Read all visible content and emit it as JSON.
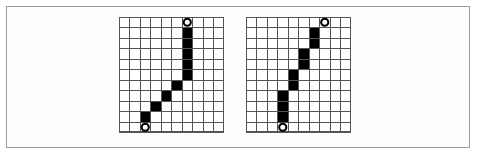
{
  "figure": {
    "title": "",
    "background_color": "#ffffff",
    "frame_color": "#9a9a9a",
    "grid_line_color": "#555555",
    "filled_cell_color": "#000000",
    "marker_fill_color": "#ffffff",
    "marker_stroke_color": "#000000",
    "panel_count": 2
  },
  "chart_data": {
    "type": "heatmap",
    "title": "",
    "subtitle": "",
    "xlabel": "",
    "ylabel": "",
    "grid": true,
    "legend_position": "none",
    "xlim": [
      0,
      10
    ],
    "ylim": [
      0,
      11
    ],
    "panels": [
      {
        "name": "left-grid",
        "cols": 10,
        "rows": 11,
        "origin_px": {
          "x": 119,
          "y": 17
        },
        "cell_px": 10.5,
        "filled_cells": [
          {
            "col": 6,
            "row": 1
          },
          {
            "col": 6,
            "row": 2
          },
          {
            "col": 6,
            "row": 3
          },
          {
            "col": 6,
            "row": 4
          },
          {
            "col": 6,
            "row": 5
          },
          {
            "col": 5,
            "row": 6
          },
          {
            "col": 4,
            "row": 7
          },
          {
            "col": 3,
            "row": 8
          },
          {
            "col": 2,
            "row": 9
          }
        ],
        "markers": [
          {
            "name": "end-marker-top",
            "col": 6,
            "row": 0
          },
          {
            "name": "start-marker-bottom",
            "col": 2,
            "row": 10
          }
        ]
      },
      {
        "name": "right-grid",
        "cols": 10,
        "rows": 11,
        "origin_px": {
          "x": 246,
          "y": 17
        },
        "cell_px": 10.5,
        "filled_cells": [
          {
            "col": 6,
            "row": 1
          },
          {
            "col": 6,
            "row": 2
          },
          {
            "col": 5,
            "row": 3
          },
          {
            "col": 5,
            "row": 4
          },
          {
            "col": 4,
            "row": 5
          },
          {
            "col": 4,
            "row": 6
          },
          {
            "col": 3,
            "row": 7
          },
          {
            "col": 3,
            "row": 8
          },
          {
            "col": 3,
            "row": 9
          }
        ],
        "markers": [
          {
            "name": "end-marker-top",
            "col": 7,
            "row": 0
          },
          {
            "name": "start-marker-bottom",
            "col": 3,
            "row": 10
          }
        ]
      }
    ]
  }
}
